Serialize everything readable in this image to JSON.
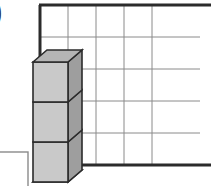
{
  "figure": {
    "title": "",
    "part_label": ")",
    "background_color": "#ffffff"
  },
  "grid": {
    "name": "base-grid",
    "columns": 5,
    "rows": 5,
    "origin_x": 40,
    "origin_y": 5,
    "cell_width": 28,
    "cell_height": 32,
    "line_color": "#8a8a8a",
    "line_width": 1,
    "border_color": "#2b2b2b",
    "border_width": 3,
    "fill_color": "#ffffff",
    "borders_drawn": [
      "top",
      "left",
      "bottom"
    ]
  },
  "cubes": {
    "name": "cube-stack",
    "count": 3,
    "column_index": 0,
    "front_face_color": "#c9c9c9",
    "side_face_color": "#9e9e9e",
    "top_face_color": "#b5b5b5",
    "bottom_face_color": "#8f8f8f",
    "edge_color": "#2b2b2b",
    "edge_width": 1.6,
    "front_left_x": 33,
    "front_width": 35,
    "front_height": 40,
    "stack_bottom_y": 182,
    "depth_dx": 14,
    "depth_dy": -12,
    "items": [
      {
        "index": 1,
        "label": "",
        "front_top_y": 62
      },
      {
        "index": 2,
        "label": "",
        "front_top_y": 102
      },
      {
        "index": 3,
        "label": "",
        "front_top_y": 142
      }
    ]
  },
  "corner_box": {
    "name": "partial-answer-box",
    "x": -8,
    "y": 152,
    "width": 36,
    "height": 42,
    "fill_color": "#ffffff",
    "border_color": "#8a8a8a",
    "border_width": 1.4
  }
}
